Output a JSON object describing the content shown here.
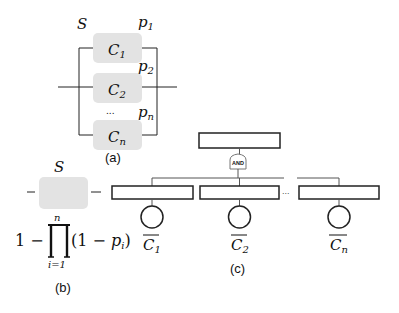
{
  "panel_a": {
    "system_label": "S",
    "components": [
      {
        "name": "C",
        "sub": "1",
        "prob": "p",
        "prob_sub": "1"
      },
      {
        "name": "C",
        "sub": "2",
        "prob": "p",
        "prob_sub": "2"
      },
      {
        "name": "C",
        "sub": "n",
        "prob": "p",
        "prob_sub": "n"
      }
    ],
    "ellipsis": "...",
    "caption": "(a)"
  },
  "panel_b": {
    "system_label": "S",
    "formula": {
      "lead": "1 −",
      "product_symbol": "∏",
      "upper": "n",
      "lower": "i=1",
      "term_open": "(1 − ",
      "term_var": "p",
      "term_sub": "i",
      "term_close": ")"
    },
    "caption": "(b)"
  },
  "panel_c": {
    "gate_label": "AND",
    "events": [
      {
        "name": "C",
        "sub": "1",
        "negated": true
      },
      {
        "name": "C",
        "sub": "2",
        "negated": true
      },
      {
        "name": "C",
        "sub": "n",
        "negated": true
      }
    ],
    "ellipsis": "...",
    "caption": "(c)"
  },
  "colors": {
    "component_fill": "#e3e3e3",
    "line": "#222222",
    "gate_stroke": "#777777"
  }
}
